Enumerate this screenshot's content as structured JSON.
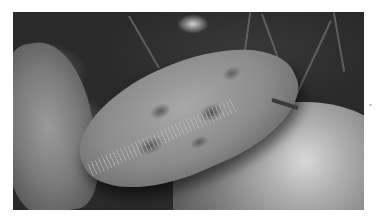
{
  "image": {
    "description": "Grayscale underwater photograph of an abalone with a mottled, spotted shell and fringed epipodial tentacles, resting on algae-covered rocks with seaweed strands in the background",
    "subject": "abalone",
    "tone": "grayscale",
    "frame": {
      "left": 13,
      "top": 12,
      "width": 351,
      "height": 198
    },
    "border_color": "#ffffff"
  }
}
